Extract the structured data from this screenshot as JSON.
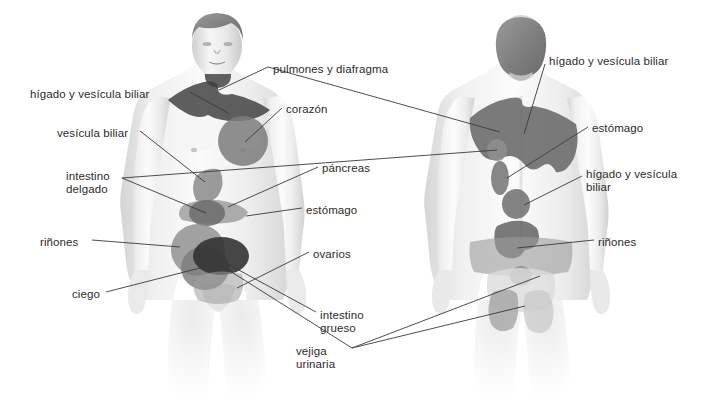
{
  "diagram": {
    "background_color": "#ffffff",
    "label_color": "#2b2b2b",
    "leader_line_color": "#3a3a3a",
    "skin_light": "#f2f2f2",
    "skin_mid": "#d8d8d8",
    "zone_mid_gray": "#8e8e8e",
    "zone_dark_gray": "#6f6f6f",
    "zone_darkest": "#3c3c3c",
    "hair_gray": "#8a8a8a"
  },
  "front_figure": {
    "name": "vista-anterior",
    "labels": [
      {
        "id": "higado-vesicula-front",
        "text": "hígado y vesícula biliar",
        "x": 30,
        "y": 88,
        "align": "left"
      },
      {
        "id": "vesicula-biliar-front",
        "text": "vesícula biliar",
        "x": 57,
        "y": 127,
        "align": "left"
      },
      {
        "id": "intestino-delgado",
        "text": "intestino\ndelgado",
        "x": 66,
        "y": 170,
        "align": "left"
      },
      {
        "id": "rinones-front",
        "text": "riñones",
        "x": 40,
        "y": 236,
        "align": "left"
      },
      {
        "id": "ciego",
        "text": "ciego",
        "x": 72,
        "y": 288,
        "align": "left"
      },
      {
        "id": "pulmones-diafragma",
        "text": "pulmones y diafragma",
        "x": 273,
        "y": 63,
        "align": "left"
      },
      {
        "id": "corazon",
        "text": "corazón",
        "x": 286,
        "y": 103,
        "align": "left"
      },
      {
        "id": "pancreas",
        "text": "páncreas",
        "x": 322,
        "y": 162,
        "align": "left"
      },
      {
        "id": "estomago-front",
        "text": "estómago",
        "x": 306,
        "y": 204,
        "align": "left"
      },
      {
        "id": "ovarios",
        "text": "ovarios",
        "x": 313,
        "y": 248,
        "align": "left"
      },
      {
        "id": "intestino-grueso",
        "text": "intestino\ngrueso",
        "x": 320,
        "y": 309,
        "align": "left"
      },
      {
        "id": "vejiga-urinaria",
        "text": "vejiga\nurinaria",
        "x": 296,
        "y": 345,
        "align": "left"
      }
    ]
  },
  "back_figure": {
    "name": "vista-posterior",
    "labels": [
      {
        "id": "higado-vesicula-back-top",
        "text": "hígado y vesícula biliar",
        "x": 549,
        "y": 55,
        "align": "left"
      },
      {
        "id": "estomago-back",
        "text": "estómago",
        "x": 592,
        "y": 122,
        "align": "left"
      },
      {
        "id": "higado-vesicula-back-mid",
        "text": "hígado y vesícula\nbiliar",
        "x": 586,
        "y": 168,
        "align": "left"
      },
      {
        "id": "rinones-back",
        "text": "riñones",
        "x": 598,
        "y": 236,
        "align": "left"
      }
    ]
  },
  "organ_zones": {
    "front": [
      {
        "name": "hombros-trapecio",
        "organ": "hígado y vesícula biliar",
        "shade": "darkest"
      },
      {
        "name": "pecho-izquierdo",
        "organ": "corazón",
        "shade": "dark"
      },
      {
        "name": "epigastrio",
        "organ": "estómago",
        "shade": "mid"
      },
      {
        "name": "hipocondrio-derecho",
        "organ": "vesícula biliar",
        "shade": "dark"
      },
      {
        "name": "periumbilical",
        "organ": "intestino delgado",
        "shade": "dark"
      },
      {
        "name": "flanco-derecho",
        "organ": "riñones",
        "shade": "mid"
      },
      {
        "name": "fosa-iliaca-derecha",
        "organ": "ciego",
        "shade": "dark"
      },
      {
        "name": "hipogastrio",
        "organ": "vejiga urinaria / intestino grueso",
        "shade": "darkest"
      },
      {
        "name": "pelvis-inferior",
        "organ": "ovarios",
        "shade": "mid"
      }
    ],
    "back": [
      {
        "name": "manto-escapular",
        "organ": "hígado y vesícula biliar",
        "shade": "dark"
      },
      {
        "name": "escapula-izquierda",
        "organ": "estómago",
        "shade": "mid"
      },
      {
        "name": "dorsal-medio",
        "organ": "hígado y vesícula biliar",
        "shade": "dark"
      },
      {
        "name": "lumbar",
        "organ": "riñones",
        "shade": "mid"
      },
      {
        "name": "sacro",
        "organ": "vejiga urinaria",
        "shade": "mid"
      },
      {
        "name": "gluteo",
        "organ": "intestino grueso",
        "shade": "mid"
      }
    ]
  }
}
